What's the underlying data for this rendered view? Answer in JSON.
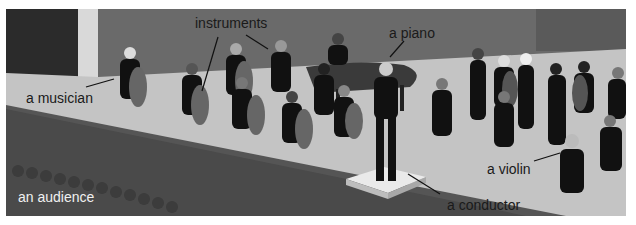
{
  "illustration": {
    "subject": "orchestra on stage",
    "labels": {
      "instruments": "instruments",
      "piano": "a piano",
      "musician": "a musician",
      "violin": "a violin",
      "conductor": "a conductor",
      "audience": "an audience"
    }
  }
}
